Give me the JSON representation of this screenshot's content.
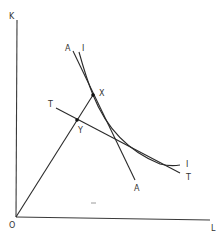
{
  "diagram": {
    "type": "economics-isoquant",
    "axes": {
      "y_label": "K",
      "x_label": "L",
      "origin_label": "O"
    },
    "curves": {
      "isoquant": {
        "label_top": "I",
        "label_bottom": "I"
      },
      "line_AA": {
        "label_top": "A",
        "label_bottom": "A"
      },
      "line_TT": {
        "label_left": "T",
        "label_right": "T"
      }
    },
    "points": {
      "X": {
        "label": "X"
      },
      "Y": {
        "label": "Y"
      }
    },
    "colors": {
      "ink": "#2a2a2a",
      "background": "#ffffff"
    }
  }
}
